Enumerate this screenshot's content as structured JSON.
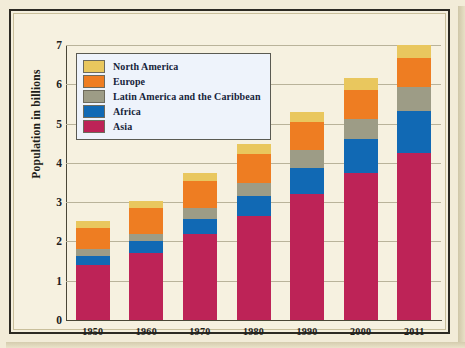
{
  "figure": {
    "background_color": "#f6f1e0",
    "frame_color": "#2c2a22"
  },
  "legend": {
    "position": "top-left",
    "items": [
      {
        "label": "North America",
        "color": "#e9c75e"
      },
      {
        "label": "Europe",
        "color": "#ee7d22"
      },
      {
        "label": "Latin America and the Caribbean",
        "color": "#9d9c86"
      },
      {
        "label": "Africa",
        "color": "#1169b4"
      },
      {
        "label": "Asia",
        "color": "#bd2357"
      }
    ]
  },
  "axes": {
    "y_title": "Population in billions",
    "y_ticks": [
      "0",
      "1",
      "2",
      "3",
      "4",
      "5",
      "6",
      "7"
    ],
    "x_ticks": [
      "1950",
      "1960",
      "1970",
      "1980",
      "1990",
      "2000",
      "2011"
    ]
  },
  "chart_data": {
    "type": "bar",
    "stacked": true,
    "title": "",
    "xlabel": "",
    "ylabel": "Population in billions",
    "ylim": [
      0,
      7
    ],
    "yticks": [
      0,
      1,
      2,
      3,
      4,
      5,
      6,
      7
    ],
    "grid": true,
    "legend_position": "top-left",
    "categories": [
      "1950",
      "1960",
      "1970",
      "1980",
      "1990",
      "2000",
      "2011"
    ],
    "series": [
      {
        "name": "Asia",
        "color": "#bd2357",
        "values": [
          1.4,
          1.7,
          2.2,
          2.65,
          3.22,
          3.75,
          4.26
        ]
      },
      {
        "name": "Africa",
        "color": "#1169b4",
        "values": [
          0.23,
          0.32,
          0.36,
          0.5,
          0.66,
          0.87,
          1.07
        ]
      },
      {
        "name": "Latin America and the Caribbean",
        "color": "#9d9c86",
        "values": [
          0.17,
          0.17,
          0.29,
          0.35,
          0.44,
          0.5,
          0.6
        ]
      },
      {
        "name": "Europe",
        "color": "#ee7d22",
        "values": [
          0.55,
          0.67,
          0.7,
          0.73,
          0.72,
          0.73,
          0.73
        ]
      },
      {
        "name": "North America",
        "color": "#e9c75e",
        "values": [
          0.17,
          0.18,
          0.2,
          0.24,
          0.26,
          0.3,
          0.35
        ]
      }
    ],
    "totals": [
      2.52,
      3.04,
      3.75,
      4.47,
      5.3,
      6.15,
      7.01
    ]
  }
}
